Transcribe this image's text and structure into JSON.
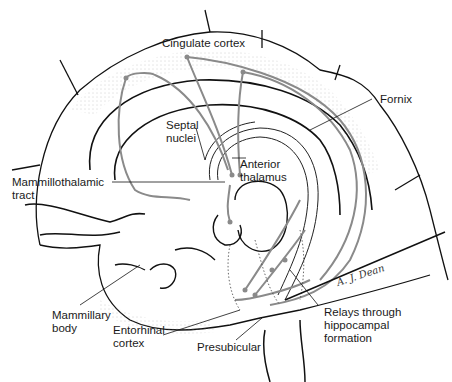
{
  "diagram": {
    "colors": {
      "outline": "#111111",
      "pathway": "#8a8a8a",
      "stipple": "#9a9a9a",
      "background": "#ffffff"
    },
    "labels": {
      "cingulate_cortex": "Cingulate cortex",
      "fornix": "Fornix",
      "septal_nuclei": "Septal\nnuclei",
      "anterior_thalamus": "Anterior\nthalamus",
      "mammillothalamic_tract": "Mammillothalamic\ntract",
      "mammillary_body": "Mammillary\nbody",
      "entorhinal_cortex": "Entorhinal\ncortex",
      "presubicular": "Presubicular",
      "relays_hippocampal": "Relays through\nhippocampal\nformation"
    },
    "signature": "A. J. Dean"
  }
}
